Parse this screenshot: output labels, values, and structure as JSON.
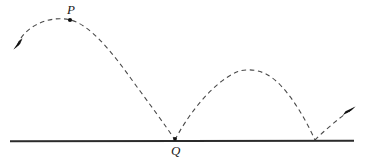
{
  "figure": {
    "background_color": "#ffffff",
    "width": 366,
    "height": 164,
    "ground_line": {
      "name": "ground-line",
      "color": "#2b2b2b",
      "thickness": 1.8,
      "x_start": 10,
      "x_end": 354,
      "y": 141
    },
    "trajectory": {
      "style": "dashed",
      "color": "#4a4a4a",
      "thickness": 1.1,
      "dash_pattern": "4.5 3.5",
      "arcs": [
        {
          "name": "arc-first-bounce",
          "start": [
            17,
            45
          ],
          "apex": [
            70,
            20
          ],
          "end": [
            175,
            140
          ],
          "control_points": [
            [
              22,
              28
            ],
            [
              52,
              14
            ],
            [
              70,
              20
            ],
            [
              96,
              28
            ],
            [
              152,
              104
            ]
          ]
        },
        {
          "name": "arc-second-bounce",
          "start": [
            175,
            140
          ],
          "apex": [
            250,
            69
          ],
          "end": [
            315,
            140
          ],
          "control_points": [
            [
              192,
              105
            ],
            [
              228,
              76
            ],
            [
              250,
              69
            ],
            [
              278,
              76
            ],
            [
              304,
              114
            ]
          ]
        },
        {
          "name": "arc-third-launch",
          "start": [
            315,
            140
          ],
          "apex": null,
          "end": [
            349,
            112
          ],
          "control_points": [
            [
              327,
              128
            ],
            [
              340,
              118
            ]
          ]
        }
      ]
    },
    "arrowheads": [
      {
        "name": "incoming-arrowhead",
        "position": [
          16,
          46
        ],
        "direction": "down-left",
        "angle_deg": 205,
        "color": "#111111"
      },
      {
        "name": "outgoing-arrowhead",
        "position": [
          351,
          110
        ],
        "direction": "up-right",
        "angle_deg": -38,
        "color": "#111111"
      }
    ],
    "markers": [
      {
        "name": "marker-P",
        "label": "P",
        "x": 70,
        "y": 20,
        "radius": 2.1,
        "color": "#111111",
        "description": "apex of first arc"
      },
      {
        "name": "marker-Q",
        "label": "Q",
        "x": 175,
        "y": 139,
        "radius": 1.9,
        "color": "#111111",
        "description": "first bounce point on ground"
      }
    ],
    "labels": {
      "p": "P",
      "q": "Q"
    }
  }
}
